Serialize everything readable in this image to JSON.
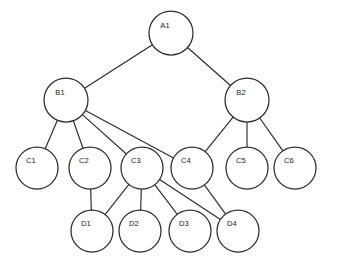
{
  "diagram": {
    "type": "tree-graph",
    "canvas": {
      "width": 340,
      "height": 277,
      "background": "#ffffff"
    },
    "style": {
      "node_fill": "#ffffff",
      "node_stroke": "#2b2b2b",
      "edge_stroke": "#2b2b2b",
      "label_color": "#1c1c1c"
    },
    "levels": [
      {
        "name": "A",
        "y": 33
      },
      {
        "name": "B",
        "y": 100
      },
      {
        "name": "C",
        "y": 168
      },
      {
        "name": "D",
        "y": 231
      }
    ],
    "nodes": [
      {
        "id": "A1",
        "label": "A1",
        "cx": 171,
        "cy": 33,
        "r": 22,
        "lx": 165,
        "ly": 26
      },
      {
        "id": "B1",
        "label": "B1",
        "cx": 66,
        "cy": 100,
        "r": 22,
        "lx": 60,
        "ly": 93
      },
      {
        "id": "B2",
        "label": "B2",
        "cx": 247,
        "cy": 100,
        "r": 22,
        "lx": 241,
        "ly": 93
      },
      {
        "id": "C1",
        "label": "C1",
        "cx": 37,
        "cy": 168,
        "r": 21,
        "lx": 31,
        "ly": 161
      },
      {
        "id": "C2",
        "label": "C2",
        "cx": 90,
        "cy": 168,
        "r": 21,
        "lx": 84,
        "ly": 161
      },
      {
        "id": "C3",
        "label": "C3",
        "cx": 142,
        "cy": 168,
        "r": 21,
        "lx": 136,
        "ly": 161
      },
      {
        "id": "C4",
        "label": "C4",
        "cx": 192,
        "cy": 168,
        "r": 21,
        "lx": 186,
        "ly": 161
      },
      {
        "id": "C5",
        "label": "C5",
        "cx": 247,
        "cy": 168,
        "r": 21,
        "lx": 241,
        "ly": 161
      },
      {
        "id": "C6",
        "label": "C6",
        "cx": 295,
        "cy": 168,
        "r": 21,
        "lx": 289,
        "ly": 161
      },
      {
        "id": "D1",
        "label": "D1",
        "cx": 92,
        "cy": 231,
        "r": 21,
        "lx": 86,
        "ly": 224
      },
      {
        "id": "D2",
        "label": "D2",
        "cx": 140,
        "cy": 231,
        "r": 21,
        "lx": 134,
        "ly": 224
      },
      {
        "id": "D3",
        "label": "D3",
        "cx": 190,
        "cy": 231,
        "r": 21,
        "lx": 184,
        "ly": 224
      },
      {
        "id": "D4",
        "label": "D4",
        "cx": 238,
        "cy": 231,
        "r": 21,
        "lx": 232,
        "ly": 224
      }
    ],
    "edges": [
      {
        "from": "A1",
        "to": "B1"
      },
      {
        "from": "A1",
        "to": "B2"
      },
      {
        "from": "B1",
        "to": "C1"
      },
      {
        "from": "B1",
        "to": "C2"
      },
      {
        "from": "B1",
        "to": "C3"
      },
      {
        "from": "B1",
        "to": "C4"
      },
      {
        "from": "B2",
        "to": "C4"
      },
      {
        "from": "B2",
        "to": "C5"
      },
      {
        "from": "B2",
        "to": "C6"
      },
      {
        "from": "C2",
        "to": "D1"
      },
      {
        "from": "C3",
        "to": "D1"
      },
      {
        "from": "C3",
        "to": "D2"
      },
      {
        "from": "C3",
        "to": "D3"
      },
      {
        "from": "C3",
        "to": "D4"
      },
      {
        "from": "C4",
        "to": "D4"
      }
    ]
  }
}
